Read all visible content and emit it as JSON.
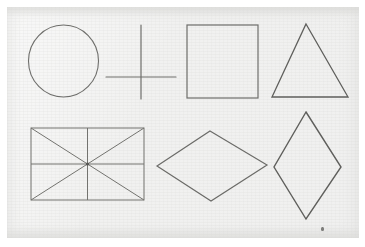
{
  "document": {
    "kind": "scanned-drawing-sheet",
    "title": "Hand-drawn geometric shapes",
    "background_color": "#f1f1f0",
    "page_color": "#ffffff",
    "ink_color": "#6e6e6b",
    "ink_color_dark": "#575754",
    "width": 365,
    "height": 247,
    "text_content": ""
  },
  "sheet": {
    "left": 7,
    "top": 7,
    "width": 352,
    "height": 231
  },
  "shapes": [
    {
      "id": "circle",
      "name": "circle",
      "row": 1,
      "column": 1,
      "label": "Circle",
      "cx": 63.5,
      "cy": 61,
      "rx": 35,
      "ry": 36,
      "stroke": "#6e6e6b",
      "stroke_width": 1.1
    },
    {
      "id": "cross",
      "name": "cross",
      "row": 1,
      "column": 2,
      "label": "Cross",
      "vertical": {
        "x": 141,
        "y1": 25,
        "y2": 99
      },
      "horizontal": {
        "y": 77,
        "x1": 106,
        "x2": 176
      },
      "stroke": "#6e6e6b",
      "stroke_width": 1.2
    },
    {
      "id": "square",
      "name": "square",
      "row": 1,
      "column": 3,
      "label": "Square",
      "x": 187,
      "y": 25,
      "width": 71,
      "height": 73,
      "stroke": "#6e6e6b",
      "stroke_width": 1.2
    },
    {
      "id": "triangle",
      "name": "triangle",
      "row": 1,
      "column": 4,
      "label": "Triangle",
      "points": "306,24 348,97 272,97",
      "stroke": "#5f5f5c",
      "stroke_width": 1.3
    },
    {
      "id": "rectangle-with-diagonals",
      "name": "rectangle-with-diagonals",
      "row": 2,
      "column": 1,
      "label": "Rectangle with diagonals and midlines",
      "x": 31,
      "y": 128,
      "width": 113,
      "height": 72,
      "center_x": 87.5,
      "center_y": 164,
      "has_diagonals": true,
      "has_vertical_midline": true,
      "has_horizontal_midline": true,
      "stroke": "#73736f",
      "stroke_width": 1.0
    },
    {
      "id": "rhombus-wide",
      "name": "rhombus-wide",
      "row": 2,
      "column": 2,
      "label": "Wide rhombus",
      "points": "210,131 267,165 211,201 157,166",
      "stroke": "#6b6b68",
      "stroke_width": 1.2
    },
    {
      "id": "rhombus-tall",
      "name": "rhombus-tall",
      "row": 2,
      "column": 3,
      "label": "Tall rhombus",
      "points": "306,112 341,167 306,219 274,167",
      "stroke": "#5f5f5c",
      "stroke_width": 1.4
    }
  ],
  "marks": [
    {
      "id": "speck-1",
      "name": "ink-speck",
      "x": 321,
      "y": 227,
      "label": "Small ink speck"
    }
  ]
}
